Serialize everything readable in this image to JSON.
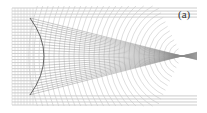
{
  "figure": {
    "panel_label": "(a)",
    "frame": {
      "x0": 12,
      "x1": 197,
      "y0": 8,
      "y1": 105
    },
    "lens": {
      "top": [
        30,
        18
      ],
      "bottom": [
        30,
        95
      ],
      "apex": [
        44,
        56
      ]
    },
    "focus": [
      182,
      56
    ],
    "ray_count": 26,
    "wavefront_count": 30,
    "colors": {
      "background": "#ffffff",
      "ray": "#8a8a8a",
      "grid": "#9a9a9a",
      "wavefront": "#c8c8c8",
      "lens": "#555555",
      "label": "#333333"
    }
  }
}
